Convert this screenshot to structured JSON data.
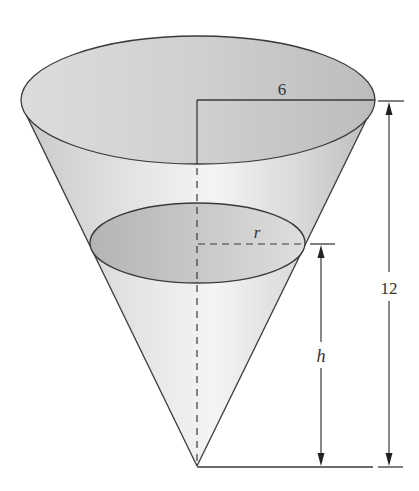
{
  "diagram": {
    "labels": {
      "top_radius": "6",
      "liquid_radius": "r",
      "liquid_height": "h",
      "total_height": "12"
    },
    "colors": {
      "stroke": "#3a3a3a",
      "top_surface": "#c8c8c8",
      "liquid_surface": "#b8b8b8",
      "cone_body_light": "#f2f2f2",
      "cone_body_dark": "#c4c4c4",
      "background": "#ffffff"
    }
  }
}
